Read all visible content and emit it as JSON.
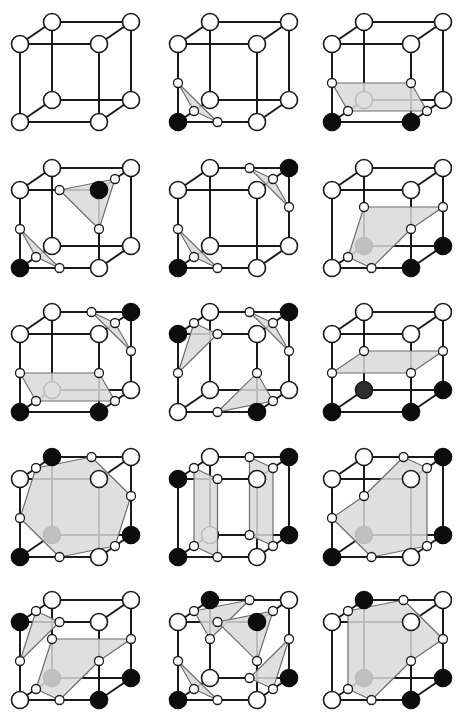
{
  "figure": {
    "grid": {
      "rows": 5,
      "cols": 3
    },
    "colors": {
      "background": "#ffffff",
      "edge": "#1a1a1a",
      "surface_fill": "#d9d9d9",
      "surface_stroke": "#6e6e6e",
      "inside_vertex": "#0d0d0d",
      "outside_vertex": "#ffffff"
    },
    "corner_legend": {
      "0": "front-bottom-left",
      "1": "front-bottom-right",
      "2": "back-bottom-right",
      "3": "back-bottom-left",
      "4": "front-top-left",
      "5": "front-top-right",
      "6": "back-top-right",
      "7": "back-top-left"
    },
    "cases": [
      {
        "id": 0,
        "row": 0,
        "col": 0,
        "filled": [],
        "polygons": []
      },
      {
        "id": 1,
        "row": 0,
        "col": 1,
        "filled": [
          0
        ],
        "polygons": [
          [
            "0-4",
            "0-1",
            "0-3"
          ]
        ]
      },
      {
        "id": 2,
        "row": 0,
        "col": 2,
        "filled": [
          0,
          1
        ],
        "polygons": [
          [
            "0-4",
            "1-5",
            "1-2",
            "0-3"
          ]
        ]
      },
      {
        "id": 3,
        "row": 1,
        "col": 0,
        "filled": [
          0,
          5
        ],
        "polygons": [
          [
            "0-4",
            "0-1",
            "0-3"
          ],
          [
            "4-5",
            "5-6",
            "1-5"
          ]
        ]
      },
      {
        "id": 4,
        "row": 1,
        "col": 1,
        "filled": [
          0,
          6
        ],
        "polygons": [
          [
            "0-4",
            "0-1",
            "0-3"
          ],
          [
            "6-7",
            "5-6",
            "2-6"
          ]
        ]
      },
      {
        "id": 5,
        "row": 1,
        "col": 2,
        "filled": [
          1,
          2,
          3
        ],
        "polygons": [
          [
            "3-7",
            "2-6",
            "1-5",
            "0-1",
            "0-3"
          ]
        ]
      },
      {
        "id": 6,
        "row": 2,
        "col": 0,
        "filled": [
          0,
          1,
          6
        ],
        "polygons": [
          [
            "0-4",
            "1-5",
            "1-2",
            "0-3"
          ],
          [
            "6-7",
            "5-6",
            "2-6"
          ]
        ]
      },
      {
        "id": 7,
        "row": 2,
        "col": 1,
        "filled": [
          4,
          1,
          6
        ],
        "polygons": [
          [
            "4-7",
            "4-5",
            "0-4"
          ],
          [
            "1-5",
            "1-2",
            "0-1"
          ],
          [
            "6-7",
            "5-6",
            "2-6"
          ]
        ]
      },
      {
        "id": 8,
        "row": 2,
        "col": 2,
        "filled": [
          0,
          1,
          2,
          3
        ],
        "polygons": [
          [
            "0-4",
            "1-5",
            "2-6",
            "3-7"
          ]
        ]
      },
      {
        "id": 9,
        "row": 3,
        "col": 0,
        "filled": [
          0,
          3,
          7,
          2
        ],
        "polygons": [
          [
            "4-7",
            "6-7",
            "2-6",
            "1-2",
            "0-1",
            "0-4"
          ]
        ]
      },
      {
        "id": 10,
        "row": 3,
        "col": 1,
        "filled": [
          0,
          4,
          2,
          6
        ],
        "polygons": [
          [
            "4-7",
            "4-5",
            "0-1",
            "0-3"
          ],
          [
            "5-6",
            "6-7",
            "2-3",
            "1-2"
          ]
        ]
      },
      {
        "id": 11,
        "row": 3,
        "col": 2,
        "filled": [
          0,
          3,
          2,
          6
        ],
        "polygons": [
          [
            "0-4",
            "3-7",
            "6-7",
            "5-6",
            "1-2",
            "0-1"
          ]
        ]
      },
      {
        "id": 12,
        "row": 4,
        "col": 0,
        "filled": [
          4,
          3,
          1,
          2
        ],
        "polygons": [
          [
            "4-7",
            "4-5",
            "0-4"
          ],
          [
            "3-7",
            "2-6",
            "1-5",
            "0-1",
            "0-3"
          ]
        ]
      },
      {
        "id": 13,
        "row": 4,
        "col": 1,
        "filled": [
          7,
          5,
          0,
          2
        ],
        "polygons": [
          [
            "4-7",
            "6-7",
            "3-7"
          ],
          [
            "4-5",
            "5-6",
            "1-5"
          ],
          [
            "0-4",
            "0-1",
            "0-3"
          ],
          [
            "2-3",
            "1-2",
            "2-6"
          ]
        ]
      },
      {
        "id": 14,
        "row": 4,
        "col": 2,
        "filled": [
          7,
          3,
          2,
          1
        ],
        "polygons": [
          [
            "4-7",
            "6-7",
            "2-6",
            "1-5",
            "0-1",
            "0-3"
          ]
        ]
      }
    ]
  }
}
